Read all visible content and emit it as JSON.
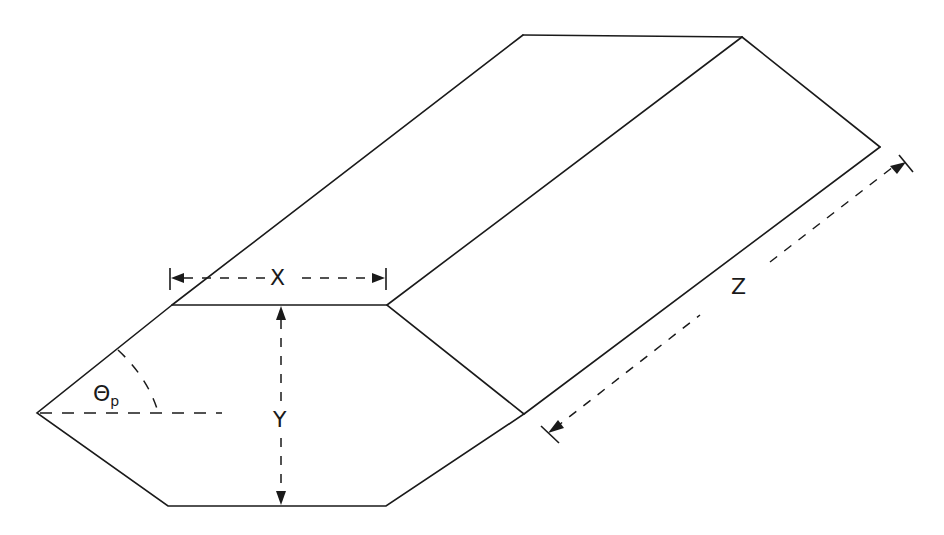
{
  "diagram": {
    "type": "isometric-prism-with-dimensions",
    "labels": {
      "x": "X",
      "y": "Y",
      "z": "Z",
      "theta": "Θ",
      "theta_sub": "p"
    },
    "colors": {
      "line": "#1a1a1a",
      "background": "#ffffff"
    }
  }
}
